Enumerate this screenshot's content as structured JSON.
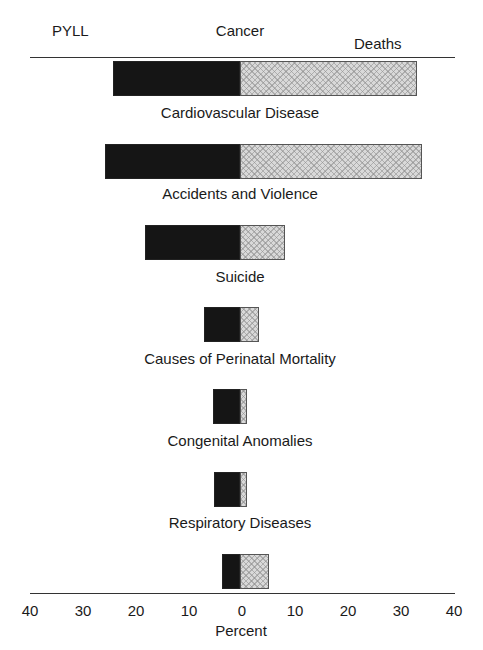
{
  "chart_data": {
    "type": "bar",
    "orientation": "horizontal-back-to-back",
    "title": "",
    "left_label": "PYLL",
    "right_label": "Deaths",
    "xlabel": "Percent",
    "xlim": [
      -40,
      40
    ],
    "xticks": [
      "40",
      "30",
      "20",
      "10",
      "0",
      "10",
      "20",
      "30",
      "40"
    ],
    "grid": false,
    "categories": [
      "Cancer",
      "Cardiovascular Disease",
      "Accidents and Violence",
      "Suicide",
      "Causes of Perinatal Mortality",
      "Congenital Anomalies",
      "Respiratory Diseases"
    ],
    "series": [
      {
        "name": "PYLL",
        "side": "left",
        "color": "#151515",
        "values": [
          23.8,
          25.3,
          17.8,
          6.8,
          5.1,
          4.9,
          3.4
        ]
      },
      {
        "name": "Deaths",
        "side": "right",
        "color": "#d9d9d9",
        "pattern": "crosshatch",
        "values": [
          33.2,
          34.1,
          8.4,
          3.6,
          1.3,
          1.3,
          5.4
        ]
      }
    ]
  },
  "labels": {
    "pyll": "PYLL",
    "deaths": "Deaths",
    "percent": "Percent",
    "cats": [
      "Cancer",
      "Cardiovascular Disease",
      "Accidents and Violence",
      "Suicide",
      "Causes of Perinatal Mortality",
      "Congenital Anomalies",
      "Respiratory Diseases"
    ],
    "ticks": [
      "40",
      "30",
      "20",
      "10",
      "0",
      "10",
      "20",
      "30",
      "40"
    ]
  }
}
